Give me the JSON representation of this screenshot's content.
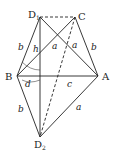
{
  "diagram": {
    "points": {
      "D1": {
        "label": "D",
        "sub": "1"
      },
      "C": {
        "label": "C"
      },
      "B": {
        "label": "B"
      },
      "A": {
        "label": "A"
      },
      "D2": {
        "label": "D",
        "sub": "2"
      }
    },
    "edge_labels": {
      "b_left_top": "b",
      "h": "h",
      "a_diag1": "a",
      "a_diag2": "a",
      "b_right": "b",
      "d": "d",
      "c": "c",
      "b_left_bottom": "b",
      "a_bottom": "a"
    }
  }
}
